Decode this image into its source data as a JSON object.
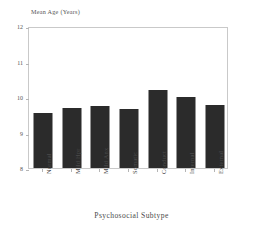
{
  "chart_data": {
    "type": "bar",
    "title": "",
    "xlabel": "Psychosocial Subtype",
    "ylabel": "Mean Age (Years)",
    "categories": [
      "Normal",
      "Mild Hpr",
      "Mild Anx",
      "Somatic",
      "Conduct",
      "Internal",
      "External"
    ],
    "values": [
      9.54,
      9.69,
      9.74,
      9.66,
      10.2,
      10.0,
      9.77
    ],
    "ylim": [
      8,
      12
    ],
    "yticks": [
      8,
      9,
      10,
      11,
      12
    ],
    "ytick_labels": [
      "8",
      "9",
      "10",
      "11",
      "12"
    ],
    "grid": false,
    "legend": null,
    "bar_color": "#2b2b2b",
    "frame_color": "#c9c9c9",
    "background_color": "#ffffff"
  }
}
